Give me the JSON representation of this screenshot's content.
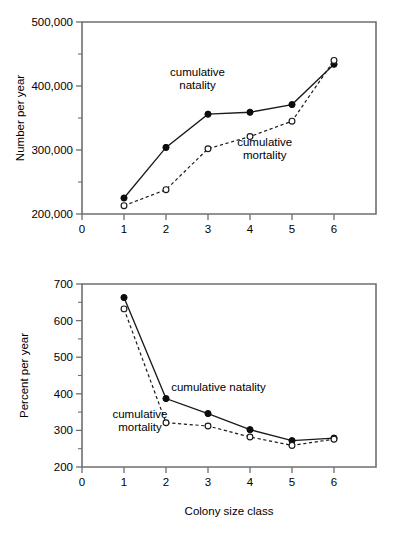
{
  "figure": {
    "background": "#ffffff",
    "ink": "#000000",
    "axis_color": "#6f6f6f"
  },
  "chart_data": [
    {
      "id": "top",
      "type": "line",
      "title": "",
      "xlabel": "",
      "ylabel": "Number per year",
      "x": [
        1,
        2,
        3,
        4,
        5,
        6
      ],
      "xticklabels": [
        "0",
        "1",
        "2",
        "3",
        "4",
        "5",
        "6"
      ],
      "xtickvalues": [
        0,
        1,
        2,
        3,
        4,
        5,
        6
      ],
      "xlim": [
        0,
        7
      ],
      "ylim": [
        200000,
        500000
      ],
      "yticklabels": [
        "200,000",
        "300,000",
        "400,000",
        "500,000"
      ],
      "ytickvalues": [
        200000,
        300000,
        400000,
        500000
      ],
      "yminorstep": 50000,
      "grid": false,
      "legend_position": "inline-annotations",
      "series": [
        {
          "name": "cumulative natality",
          "marker": "filled-circle",
          "linestyle": "solid",
          "values": [
            225000,
            304000,
            356000,
            359000,
            371000,
            434000
          ]
        },
        {
          "name": "cumulative mortality",
          "marker": "open-circle",
          "linestyle": "dashed",
          "values": [
            213000,
            238000,
            302000,
            321000,
            345000,
            440000
          ]
        }
      ],
      "annotations": [
        {
          "text_line1": "cumulative",
          "text_line2": "natality",
          "x": 2.75,
          "y": 415000,
          "anchor": "middle"
        },
        {
          "text_line1": "cumulative",
          "text_line2": "mortality",
          "x": 4.35,
          "y": 307000,
          "anchor": "middle"
        }
      ]
    },
    {
      "id": "bottom",
      "type": "line",
      "title": "",
      "xlabel": "Colony size class",
      "ylabel": "Percent per year",
      "x": [
        1,
        2,
        3,
        4,
        5,
        6
      ],
      "xticklabels": [
        "0",
        "1",
        "2",
        "3",
        "4",
        "5",
        "6"
      ],
      "xtickvalues": [
        0,
        1,
        2,
        3,
        4,
        5,
        6
      ],
      "xlim": [
        0,
        7
      ],
      "ylim": [
        200,
        700
      ],
      "yticklabels": [
        "200",
        "300",
        "400",
        "500",
        "600",
        "700"
      ],
      "ytickvalues": [
        200,
        300,
        400,
        500,
        600,
        700
      ],
      "yminorstep": 50,
      "grid": false,
      "legend_position": "inline-annotations",
      "series": [
        {
          "name": "cumulative natality",
          "marker": "filled-circle",
          "linestyle": "solid",
          "values": [
            663,
            387,
            346,
            302,
            272,
            279
          ]
        },
        {
          "name": "cumulative mortality",
          "marker": "open-circle",
          "linestyle": "dashed",
          "values": [
            632,
            321,
            312,
            282,
            259,
            276
          ]
        }
      ],
      "annotations": [
        {
          "text_line1": "cumulative natality",
          "text_line2": "",
          "x": 3.25,
          "y": 408,
          "anchor": "middle"
        },
        {
          "text_line1": "cumulative",
          "text_line2": "mortality",
          "x": 1.38,
          "y": 335,
          "anchor": "middle"
        }
      ]
    }
  ]
}
